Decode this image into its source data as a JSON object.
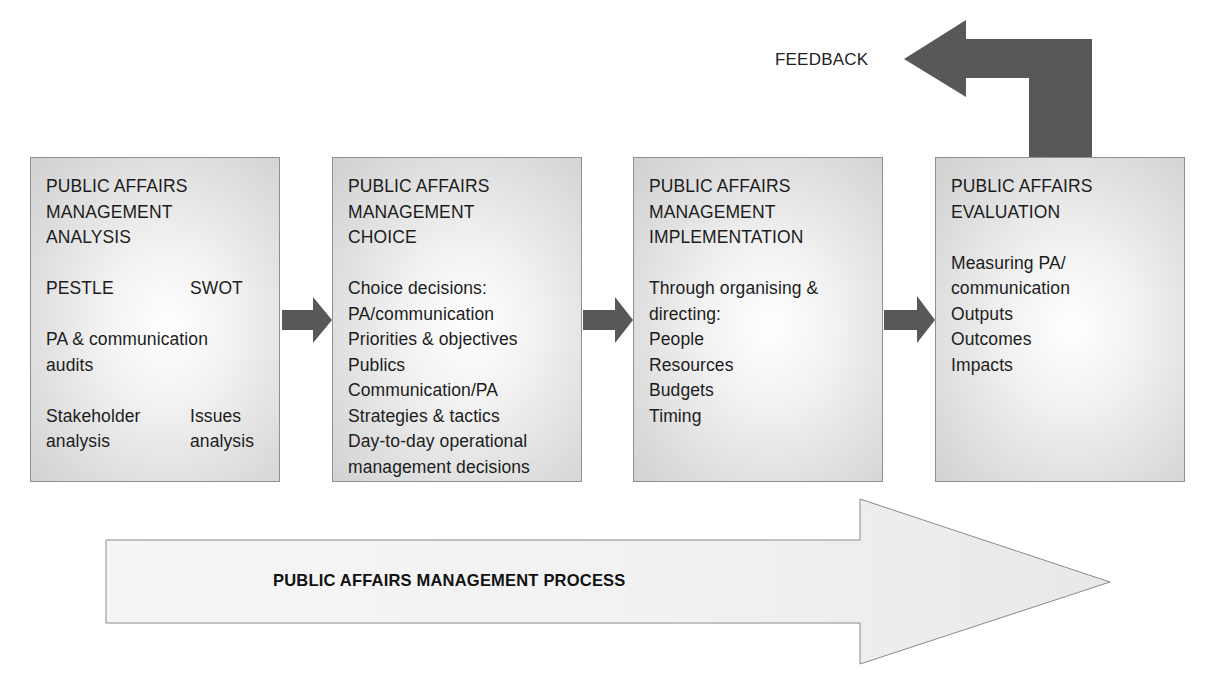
{
  "diagram": {
    "feedback": {
      "label": "FEEDBACK",
      "arrow_color": "#585858"
    },
    "stages": [
      {
        "id": "analysis",
        "title_lines": [
          "PUBLIC AFFAIRS",
          "MANAGEMENT",
          "ANALYSIS"
        ],
        "rows": [
          {
            "left": "PESTLE",
            "right": "SWOT"
          },
          {
            "full": [
              "PA & communication",
              "audits"
            ]
          },
          {
            "left_lines": [
              "Stakeholder",
              "analysis"
            ],
            "right_lines": [
              "Issues",
              "analysis"
            ]
          }
        ]
      },
      {
        "id": "choice",
        "title_lines": [
          "PUBLIC AFFAIRS",
          "MANAGEMENT",
          "CHOICE"
        ],
        "body_lines": [
          "Choice decisions:",
          "PA/communication",
          "Priorities & objectives",
          "Publics",
          "Communication/PA",
          "Strategies & tactics",
          "Day-to-day operational",
          "management decisions"
        ]
      },
      {
        "id": "implementation",
        "title_lines": [
          "PUBLIC AFFAIRS",
          "MANAGEMENT",
          "IMPLEMENTATION"
        ],
        "body_lines": [
          "Through organising &",
          "directing:",
          "People",
          "Resources",
          "Budgets",
          "Timing"
        ]
      },
      {
        "id": "evaluation",
        "title_lines": [
          "PUBLIC AFFAIRS",
          "EVALUATION"
        ],
        "body_lines": [
          "Measuring PA/",
          "communication",
          "Outputs",
          "Outcomes",
          "Impacts"
        ]
      }
    ],
    "process_arrow": {
      "label": "PUBLIC AFFAIRS MANAGEMENT PROCESS",
      "fill": "#efefef",
      "stroke": "#8a8a8a"
    },
    "connector_color": "#585858",
    "box_border": "#8f8f8f"
  }
}
